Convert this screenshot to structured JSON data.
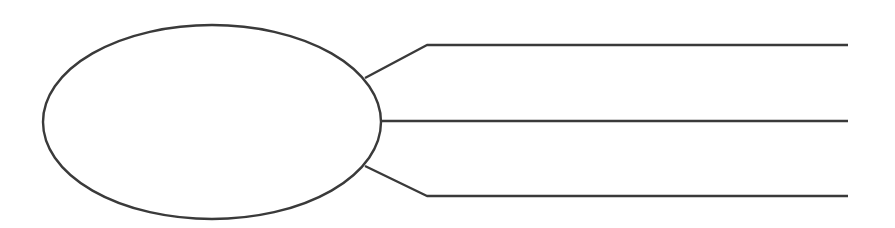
{
  "diagram": {
    "type": "graphic-organizer",
    "stroke_color": "#3a3a3a",
    "background": "#ffffff",
    "central_node": {
      "shape": "ellipse",
      "text": "",
      "cx": 212,
      "cy": 122,
      "rx": 169,
      "ry": 97
    },
    "branches": [
      {
        "text": "",
        "path": "365,78 427,45 848,45"
      },
      {
        "text": "",
        "path": "381,121 848,121"
      },
      {
        "text": "",
        "path": "365,166 427,196 848,196"
      }
    ]
  }
}
